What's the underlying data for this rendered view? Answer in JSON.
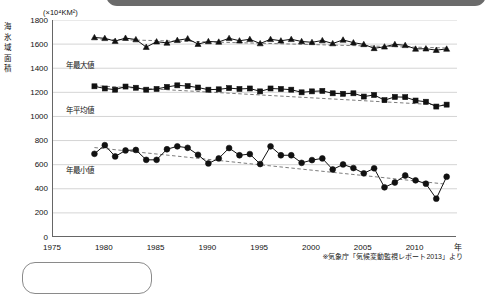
{
  "header": {
    "title": "北極域の海氷域面積の経年変化"
  },
  "axes": {
    "unit_caption": "(×10",
    "unit_exponent": "4",
    "unit_caption_tail": "KM2)",
    "unit_caption_full": "(×10⁴KM²)",
    "y_title": "海氷域面積",
    "x_unit": "年",
    "y_ticks": [
      "1800",
      "1600",
      "1400",
      "1200",
      "1000",
      "800",
      "600",
      "400",
      "200",
      "0"
    ],
    "x_ticks": [
      "1975",
      "1980",
      "1985",
      "1990",
      "1995",
      "2000",
      "2005",
      "2010"
    ]
  },
  "series_labels": {
    "max": "年最大値",
    "mean": "年平均値",
    "min": "年最小値"
  },
  "source_note": "※気象庁「気候変動監視レポート2013」より",
  "colors": {
    "line": "#111111",
    "trend": "#6d6d6d",
    "grid": "#c9c9c9",
    "axis": "#666666",
    "header_bar": "#6b6b6b"
  },
  "chart_data": {
    "type": "line",
    "title": "北極域の海氷域面積の経年変化",
    "xlabel": "年",
    "ylabel": "海氷域面積 (×10⁴KM²)",
    "xlim": [
      1975,
      2014
    ],
    "ylim": [
      0,
      1800
    ],
    "ytick_step": 200,
    "xtick_step": 5,
    "grid": "horizontal",
    "legend": "inline-labels",
    "x": [
      1979,
      1980,
      1981,
      1982,
      1983,
      1984,
      1985,
      1986,
      1987,
      1988,
      1989,
      1990,
      1991,
      1992,
      1993,
      1994,
      1995,
      1996,
      1997,
      1998,
      1999,
      2000,
      2001,
      2002,
      2003,
      2004,
      2005,
      2006,
      2007,
      2008,
      2009,
      2010,
      2011,
      2012,
      2013
    ],
    "series": [
      {
        "name": "年最大値",
        "marker": "triangle",
        "values": [
          1655,
          1648,
          1625,
          1650,
          1638,
          1575,
          1620,
          1610,
          1632,
          1645,
          1600,
          1622,
          1618,
          1648,
          1628,
          1640,
          1605,
          1640,
          1628,
          1640,
          1622,
          1615,
          1630,
          1605,
          1635,
          1612,
          1598,
          1565,
          1578,
          1598,
          1590,
          1560,
          1562,
          1550,
          1560
        ],
        "trend": {
          "type": "linear",
          "start_year": 1979,
          "start_value": 1642,
          "end_year": 2013,
          "end_value": 1568
        }
      },
      {
        "name": "年平均値",
        "marker": "square",
        "values": [
          1250,
          1232,
          1222,
          1248,
          1238,
          1222,
          1228,
          1245,
          1258,
          1252,
          1240,
          1222,
          1225,
          1235,
          1228,
          1232,
          1208,
          1232,
          1228,
          1222,
          1200,
          1208,
          1212,
          1192,
          1188,
          1192,
          1165,
          1178,
          1135,
          1162,
          1160,
          1132,
          1122,
          1082,
          1098
        ],
        "trend": {
          "type": "linear",
          "start_year": 1979,
          "start_value": 1255,
          "end_year": 2013,
          "end_value": 1092
        }
      },
      {
        "name": "年最小値",
        "marker": "circle",
        "values": [
          690,
          762,
          668,
          718,
          722,
          640,
          640,
          728,
          752,
          740,
          682,
          610,
          652,
          738,
          678,
          688,
          605,
          752,
          678,
          678,
          615,
          638,
          652,
          560,
          602,
          572,
          528,
          570,
          412,
          452,
          510,
          470,
          442,
          318,
          500
        ],
        "trend": {
          "type": "linear",
          "start_year": 1979,
          "start_value": 742,
          "end_year": 2013,
          "end_value": 438
        }
      }
    ]
  }
}
